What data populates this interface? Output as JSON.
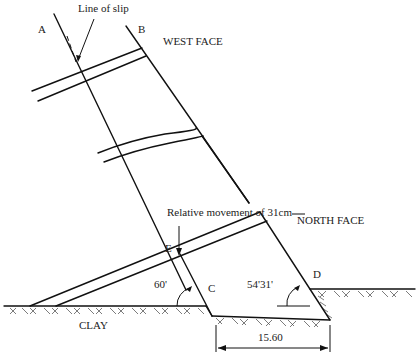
{
  "diagram": {
    "labels": {
      "line_of_slip": "Line of slip",
      "point_a": "A",
      "point_b": "B",
      "west_face": "WEST FACE",
      "relative_movement": "Relative movement of 31cm",
      "north_face": "NORTH FACE",
      "point_e": "E",
      "point_c": "C",
      "point_d": "D",
      "angle_c": "60'",
      "angle_d": "54'31'",
      "clay": "CLAY",
      "dimension": "15.60"
    },
    "colors": {
      "line": "#111111",
      "text": "#222222",
      "background": "#ffffff"
    }
  }
}
